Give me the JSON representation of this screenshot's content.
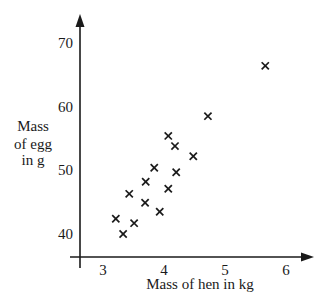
{
  "chart_data": {
    "type": "scatter",
    "title": "",
    "xlabel": "Mass of hen in kg",
    "ylabel_lines": [
      "Mass",
      "of egg",
      "in g"
    ],
    "ylabel": "Mass of egg in g",
    "x_ticks": [
      3,
      4,
      5,
      6
    ],
    "y_ticks": [
      40,
      50,
      60,
      70
    ],
    "xlim": [
      2.6,
      6.5
    ],
    "ylim": [
      36,
      77
    ],
    "grid": false,
    "legend": null,
    "marker": "x",
    "color": "#1a1a1a",
    "points": [
      {
        "x": 3.21,
        "y": 42.4
      },
      {
        "x": 3.33,
        "y": 40.0
      },
      {
        "x": 3.51,
        "y": 41.7
      },
      {
        "x": 3.43,
        "y": 46.3
      },
      {
        "x": 3.69,
        "y": 44.9
      },
      {
        "x": 3.7,
        "y": 48.2
      },
      {
        "x": 3.84,
        "y": 50.4
      },
      {
        "x": 3.93,
        "y": 43.5
      },
      {
        "x": 4.07,
        "y": 47.1
      },
      {
        "x": 4.07,
        "y": 55.4
      },
      {
        "x": 4.18,
        "y": 53.8
      },
      {
        "x": 4.2,
        "y": 49.7
      },
      {
        "x": 4.48,
        "y": 52.2
      },
      {
        "x": 4.72,
        "y": 58.5
      },
      {
        "x": 5.66,
        "y": 66.4
      }
    ]
  }
}
